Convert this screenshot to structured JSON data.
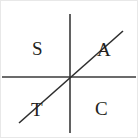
{
  "figure": {
    "kind": "trigonometry-quadrant-diagram",
    "mnemonic": "ASTC",
    "width": 138,
    "height": 138,
    "background_color": "#ffffff",
    "border_color": "#e8e8e8",
    "ink_color": "#241f20"
  },
  "axes": {
    "origin": {
      "x": 70,
      "y": 77
    },
    "x_axis": {
      "label": "",
      "x1": 2,
      "y1": 77,
      "x2": 136,
      "y2": 77,
      "stroke": "#3a3a3a",
      "width": 1.6
    },
    "y_axis": {
      "label": "",
      "x1": 70,
      "y1": 14,
      "x2": 70,
      "y2": 133,
      "stroke": "#3a3a3a",
      "width": 1.6
    }
  },
  "terminal_ray": {
    "name": "diagonal-line",
    "x1": 19,
    "y1": 123,
    "x2": 123,
    "y2": 31,
    "stroke": "#2e2e2e",
    "width": 1.6
  },
  "quadrants": [
    {
      "id": "S",
      "label": "S",
      "position": "upper-left",
      "quadrant": 2,
      "meaning": "Sine"
    },
    {
      "id": "A",
      "label": "A",
      "position": "upper-right",
      "quadrant": 1,
      "meaning": "All"
    },
    {
      "id": "T",
      "label": "T",
      "position": "lower-left",
      "quadrant": 3,
      "meaning": "Tangent"
    },
    {
      "id": "C",
      "label": "C",
      "position": "lower-right",
      "quadrant": 4,
      "meaning": "Cosine"
    }
  ]
}
